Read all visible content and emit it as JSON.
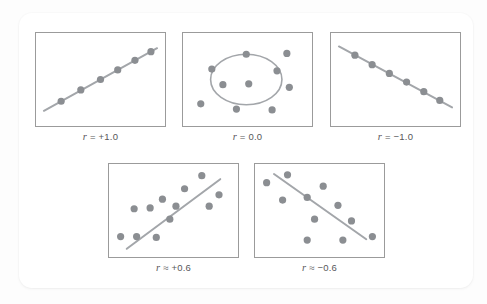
{
  "figure": {
    "background_color": "#fdfdfd",
    "card_color": "#ffffff",
    "dot_color": "#8b8e92",
    "line_color": "#a3a6aa",
    "border_color": "#9b9b9b",
    "label_color": "#58585a"
  },
  "chart_data": [
    {
      "type": "scatter",
      "id": "perfect-positive",
      "title": "",
      "label": "r = +1.0",
      "label_parts": {
        "variable": "r",
        "relation": "=",
        "value": "+1.0"
      },
      "correlation": 1.0,
      "xlim": [
        0,
        100
      ],
      "ylim": [
        0,
        100
      ],
      "grid": false,
      "legend": "none",
      "trendline": {
        "x": [
          4,
          96
        ],
        "y": [
          14,
          86
        ]
      },
      "points": [
        {
          "x": 18,
          "y": 25
        },
        {
          "x": 34,
          "y": 38
        },
        {
          "x": 50,
          "y": 50
        },
        {
          "x": 64,
          "y": 61
        },
        {
          "x": 78,
          "y": 72
        },
        {
          "x": 91,
          "y": 82
        }
      ]
    },
    {
      "type": "scatter",
      "id": "zero-correlation",
      "title": "",
      "label": "r = 0.0",
      "label_parts": {
        "variable": "r",
        "relation": "=",
        "value": "0.0"
      },
      "correlation": 0.0,
      "xlim": [
        0,
        100
      ],
      "ylim": [
        0,
        100
      ],
      "grid": false,
      "legend": "none",
      "annotation_shape": {
        "type": "circle",
        "cx": 49,
        "cy": 50,
        "r": 29
      },
      "points": [
        {
          "x": 49,
          "y": 79
        },
        {
          "x": 21,
          "y": 62
        },
        {
          "x": 82,
          "y": 80
        },
        {
          "x": 74,
          "y": 60
        },
        {
          "x": 30,
          "y": 44
        },
        {
          "x": 51,
          "y": 45
        },
        {
          "x": 84,
          "y": 41
        },
        {
          "x": 12,
          "y": 22
        },
        {
          "x": 41,
          "y": 16
        },
        {
          "x": 70,
          "y": 15
        }
      ]
    },
    {
      "type": "scatter",
      "id": "perfect-negative",
      "title": "",
      "label": "r = −1.0",
      "label_parts": {
        "variable": "r",
        "relation": "=",
        "value": "−1.0"
      },
      "correlation": -1.0,
      "xlim": [
        0,
        100
      ],
      "ylim": [
        0,
        100
      ],
      "grid": false,
      "legend": "none",
      "trendline": {
        "x": [
          4,
          96
        ],
        "y": [
          88,
          18
        ]
      },
      "points": [
        {
          "x": 17,
          "y": 78
        },
        {
          "x": 31,
          "y": 67
        },
        {
          "x": 45,
          "y": 57
        },
        {
          "x": 59,
          "y": 47
        },
        {
          "x": 73,
          "y": 36
        },
        {
          "x": 86,
          "y": 26
        }
      ]
    },
    {
      "type": "scatter",
      "id": "moderate-positive",
      "title": "",
      "label": "r ≈ +0.6",
      "label_parts": {
        "variable": "r",
        "relation": "≈",
        "value": "+0.6"
      },
      "correlation": 0.6,
      "xlim": [
        0,
        100
      ],
      "ylim": [
        0,
        100
      ],
      "grid": false,
      "legend": "none",
      "trendline": {
        "x": [
          12,
          88
        ],
        "y": [
          6,
          86
        ]
      },
      "points": [
        {
          "x": 73,
          "y": 90
        },
        {
          "x": 59,
          "y": 75
        },
        {
          "x": 87,
          "y": 68
        },
        {
          "x": 41,
          "y": 63
        },
        {
          "x": 52,
          "y": 55
        },
        {
          "x": 79,
          "y": 55
        },
        {
          "x": 18,
          "y": 52
        },
        {
          "x": 31,
          "y": 53
        },
        {
          "x": 47,
          "y": 40
        },
        {
          "x": 7,
          "y": 20
        },
        {
          "x": 20,
          "y": 20
        },
        {
          "x": 36,
          "y": 19
        }
      ]
    },
    {
      "type": "scatter",
      "id": "moderate-negative",
      "title": "",
      "label": "r ≈ −0.6",
      "label_parts": {
        "variable": "r",
        "relation": "≈",
        "value": "−0.6"
      },
      "correlation": -0.6,
      "xlim": [
        0,
        100
      ],
      "ylim": [
        0,
        100
      ],
      "grid": false,
      "legend": "none",
      "trendline": {
        "x": [
          13,
          88
        ],
        "y": [
          92,
          17
        ]
      },
      "points": [
        {
          "x": 24,
          "y": 91
        },
        {
          "x": 7,
          "y": 82
        },
        {
          "x": 53,
          "y": 78
        },
        {
          "x": 20,
          "y": 62
        },
        {
          "x": 40,
          "y": 65
        },
        {
          "x": 65,
          "y": 56
        },
        {
          "x": 46,
          "y": 40
        },
        {
          "x": 76,
          "y": 38
        },
        {
          "x": 40,
          "y": 16
        },
        {
          "x": 69,
          "y": 16
        },
        {
          "x": 93,
          "y": 20
        }
      ]
    }
  ]
}
